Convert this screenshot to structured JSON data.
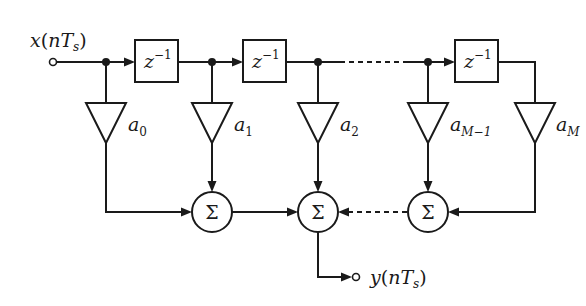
{
  "diagram": {
    "input": {
      "label_main": "x",
      "label_paren_open": "(",
      "label_n": "nT",
      "label_sub": "s",
      "label_paren_close": ")"
    },
    "output": {
      "label_main": "y",
      "label_paren_open": "(",
      "label_n": "nT",
      "label_sub": "s",
      "label_paren_close": ")"
    },
    "delays": [
      {
        "label": "z",
        "exp": "−1"
      },
      {
        "label": "z",
        "exp": "−1"
      },
      {
        "label": "z",
        "exp": "−1"
      }
    ],
    "coefficients": [
      {
        "base": "a",
        "sub": "0"
      },
      {
        "base": "a",
        "sub": "1"
      },
      {
        "base": "a",
        "sub": "2"
      },
      {
        "base": "a",
        "sub": "M−1"
      },
      {
        "base": "a",
        "sub": "M"
      }
    ],
    "summers": [
      {
        "symbol": "Σ"
      },
      {
        "symbol": "Σ"
      },
      {
        "symbol": "Σ"
      }
    ],
    "colors": {
      "stroke": "#1a1a1a",
      "background": "#ffffff"
    }
  }
}
